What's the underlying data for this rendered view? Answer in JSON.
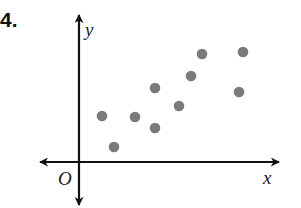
{
  "problem": {
    "number": "4."
  },
  "axes": {
    "x_label": "x",
    "y_label": "y",
    "origin_label": "O",
    "axis_color": "#111111"
  },
  "point_color": "#7a7a7a",
  "chart_data": {
    "type": "scatter",
    "title": "",
    "xlabel": "x",
    "ylabel": "y",
    "origin_label": "O",
    "grid": false,
    "legend": null,
    "note": "No tick marks or numeric scale; coordinates are in approximate unit grid estimated from pixel positions (origin at axes intersection).",
    "points": [
      {
        "x": 1.0,
        "y": 2.0
      },
      {
        "x": 1.5,
        "y": 0.7
      },
      {
        "x": 2.5,
        "y": 2.0
      },
      {
        "x": 3.4,
        "y": 3.2
      },
      {
        "x": 3.4,
        "y": 1.5
      },
      {
        "x": 4.4,
        "y": 2.4
      },
      {
        "x": 4.9,
        "y": 3.6
      },
      {
        "x": 5.4,
        "y": 4.5
      },
      {
        "x": 7.0,
        "y": 2.9
      },
      {
        "x": 7.2,
        "y": 4.6
      }
    ],
    "pixel_points": [
      [
        102,
        116
      ],
      [
        114,
        147
      ],
      [
        135,
        117
      ],
      [
        155,
        88
      ],
      [
        155,
        128
      ],
      [
        179,
        106
      ],
      [
        191,
        76
      ],
      [
        202,
        54
      ],
      [
        239,
        92
      ],
      [
        243,
        52
      ]
    ],
    "xlim": [
      -1.7,
      8.6
    ],
    "ylim": [
      -1.8,
      6.2
    ]
  }
}
